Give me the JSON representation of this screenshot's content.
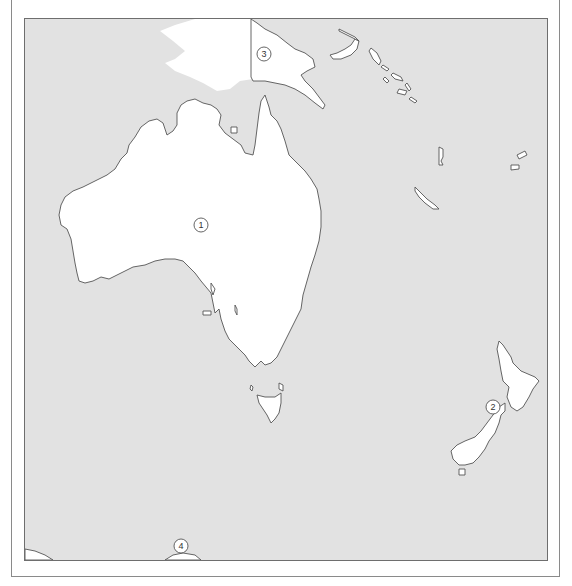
{
  "map": {
    "region": "Oceania",
    "colors": {
      "sea": "#e2e2e2",
      "land": "#ffffff",
      "outline": "#555555",
      "frame": "#6e6e6e"
    },
    "markers": [
      {
        "id": 1,
        "label": "1",
        "x": 176,
        "y": 206,
        "feature": "Australia"
      },
      {
        "id": 2,
        "label": "2",
        "x": 468,
        "y": 388,
        "feature": "New Zealand"
      },
      {
        "id": 3,
        "label": "3",
        "x": 239,
        "y": 35,
        "feature": "Papua New Guinea"
      },
      {
        "id": 4,
        "label": "4",
        "x": 156,
        "y": 527,
        "feature": "Antarctica"
      }
    ]
  }
}
